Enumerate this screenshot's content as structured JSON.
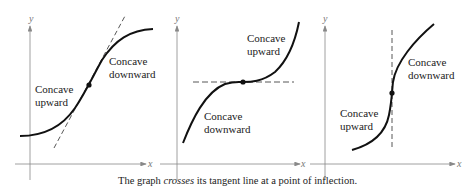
{
  "figure": {
    "caption_pre": "The graph ",
    "caption_emph": "crosses",
    "caption_post": " its tangent line at a point of inflection.",
    "axis_x_label": "x",
    "axis_y_label": "y",
    "colors": {
      "curve": "#111111",
      "axis": "#888888",
      "tangent": "#444444",
      "text": "#222222"
    },
    "panels": [
      {
        "name": "oblique-tangent",
        "label_left": [
          "Concave",
          "upward"
        ],
        "label_right": [
          "Concave",
          "downward"
        ],
        "tangent": "oblique"
      },
      {
        "name": "horizontal-tangent",
        "label_upper": [
          "Concave",
          "upward"
        ],
        "label_lower": [
          "Concave",
          "downward"
        ],
        "tangent": "horizontal"
      },
      {
        "name": "vertical-tangent",
        "label_left": [
          "Concave",
          "upward"
        ],
        "label_right": [
          "Concave",
          "downward"
        ],
        "tangent": "vertical"
      }
    ]
  }
}
